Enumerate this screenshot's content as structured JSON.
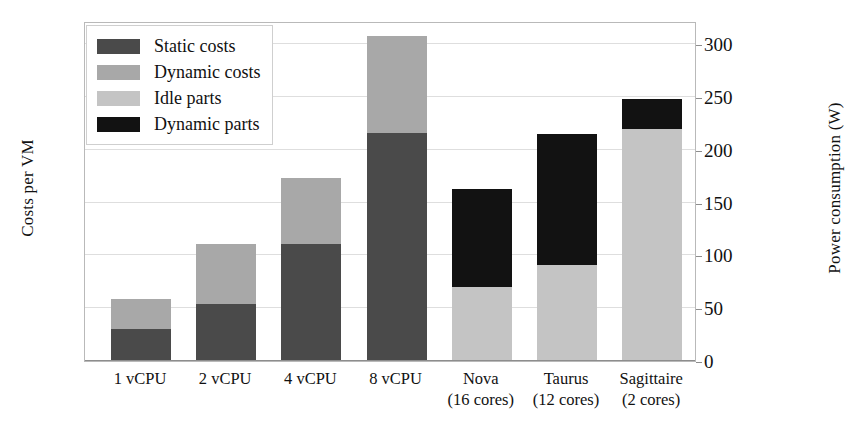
{
  "chart_data": {
    "type": "bar",
    "stacked": true,
    "title": "",
    "xlabel": "",
    "ylabel": "Costs per VM",
    "ylabel_right": "Power consumption (W)",
    "categories": [
      {
        "line1": "1 vCPU",
        "line2": ""
      },
      {
        "line1": "2 vCPU",
        "line2": ""
      },
      {
        "line1": "4 vCPU",
        "line2": ""
      },
      {
        "line1": "8 vCPU",
        "line2": ""
      },
      {
        "line1": "Nova",
        "line2": "(16 cores)"
      },
      {
        "line1": "Taurus",
        "line2": "(12 cores)"
      },
      {
        "line1": "Sagittaire",
        "line2": "(2 cores)"
      }
    ],
    "right_axis": {
      "ticks": [
        0,
        50,
        100,
        150,
        200,
        250,
        300
      ],
      "ylim": [
        0,
        322
      ],
      "grid": true
    },
    "left_axis": {
      "ticks": [],
      "grid": false
    },
    "legend": {
      "position": "top-left",
      "entries": [
        {
          "label": "Static costs",
          "color": "#4a4a4a"
        },
        {
          "label": "Dynamic costs",
          "color": "#a8a8a8"
        },
        {
          "label": "Idle parts",
          "color": "#c4c4c4"
        },
        {
          "label": "Dynamic parts",
          "color": "#121212"
        }
      ]
    },
    "series": [
      {
        "name": "Static costs",
        "color": "#4a4a4a",
        "applies_to": [
          "1 vCPU",
          "2 vCPU",
          "4 vCPU",
          "8 vCPU"
        ],
        "values": [
          30,
          54,
          111,
          216,
          null,
          null,
          null
        ]
      },
      {
        "name": "Dynamic costs",
        "color": "#a8a8a8",
        "applies_to": [
          "1 vCPU",
          "2 vCPU",
          "4 vCPU",
          "8 vCPU"
        ],
        "values": [
          29,
          57,
          62,
          92,
          null,
          null,
          null
        ]
      },
      {
        "name": "Idle parts",
        "color": "#c4c4c4",
        "applies_to": [
          "Nova",
          "Taurus",
          "Sagittaire"
        ],
        "values": [
          null,
          null,
          null,
          null,
          70,
          91,
          220
        ]
      },
      {
        "name": "Dynamic parts",
        "color": "#121212",
        "applies_to": [
          "Nova",
          "Taurus",
          "Sagittaire"
        ],
        "values": [
          null,
          null,
          null,
          null,
          93,
          124,
          28
        ]
      }
    ],
    "totals": [
      59,
      111,
      173,
      308,
      163,
      215,
      248
    ]
  },
  "colors": {
    "static_costs": "#4a4a4a",
    "dynamic_costs": "#a8a8a8",
    "idle_parts": "#c4c4c4",
    "dynamic_parts": "#121212",
    "gridline": "#dedede",
    "frame": "#b9b9b9",
    "text": "#111111"
  }
}
